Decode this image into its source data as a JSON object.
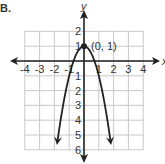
{
  "problem_label": "B.",
  "chart_data": {
    "type": "line",
    "title": "",
    "xlabel": "x",
    "ylabel": "y",
    "xlim": [
      -4,
      4
    ],
    "ylim": [
      -6,
      2
    ],
    "grid": true,
    "x_ticks": [
      -4,
      -3,
      -2,
      -1,
      1,
      2,
      3,
      4
    ],
    "y_ticks": [
      2,
      1,
      -1,
      -2,
      -3,
      -4,
      -5,
      -6
    ],
    "y_tick_labels": [
      "2",
      "1",
      "1",
      "2",
      "3",
      "4",
      "5",
      "6"
    ],
    "x_tick_labels": [
      "-4",
      "-3",
      "-2",
      "-1",
      "1",
      "2",
      "3",
      "4"
    ],
    "series": [
      {
        "name": "parabola",
        "equation": "y = -2x^2 + 1",
        "color": "#222222",
        "x": [
          -1.8,
          -1.5,
          -1,
          -0.5,
          0,
          0.5,
          1,
          1.5,
          1.8
        ],
        "y": [
          -5.48,
          -3.5,
          -1,
          0.5,
          1,
          0.5,
          -1,
          -3.5,
          -5.48
        ]
      }
    ],
    "annotations": [
      {
        "text": "(0, 1)",
        "x": 0,
        "y": 1,
        "marker": "point"
      }
    ]
  }
}
